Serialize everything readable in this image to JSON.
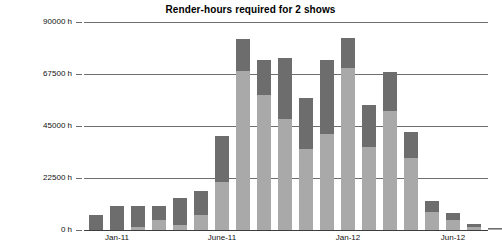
{
  "chart_data": {
    "type": "bar",
    "stacked": true,
    "title": "Render-hours required for 2 shows",
    "xlabel": "",
    "ylabel": "",
    "ylim": [
      0,
      90000
    ],
    "grid": true,
    "legend": "none",
    "y_unit": "h",
    "y_ticks": [
      {
        "value": 0,
        "label": "0 h"
      },
      {
        "value": 22500,
        "label": "22500 h"
      },
      {
        "value": 45000,
        "label": "45000 h"
      },
      {
        "value": 67500,
        "label": "67500 h"
      },
      {
        "value": 90000,
        "label": "90000 h"
      }
    ],
    "x_ticks": [
      {
        "index": 1,
        "label": "Jan-11"
      },
      {
        "index": 6,
        "label": "June-11"
      },
      {
        "index": 12,
        "label": "Jan-12"
      },
      {
        "index": 17,
        "label": "Jun-12"
      }
    ],
    "categories": [
      "Nov-10",
      "Dec-10",
      "Jan-11",
      "Feb-11",
      "Mar-11",
      "Apr-11",
      "May-11",
      "June-11",
      "Jul-11",
      "Aug-11",
      "Sep-11",
      "Oct-11",
      "Nov-11",
      "Dec-11",
      "Jan-12",
      "Feb-12",
      "Mar-12",
      "Apr-12",
      "May-12",
      "Jun-12"
    ],
    "series": [
      {
        "name": "Show A",
        "color": "#a9a9a9",
        "values": [
          0,
          0,
          1500,
          4200,
          2000,
          6500,
          21000,
          69000,
          58500,
          48000,
          35000,
          41500,
          70000,
          36000,
          51500,
          31000,
          8000,
          4500,
          1500,
          500
        ]
      },
      {
        "name": "Show B",
        "color": "#6d6d6d",
        "values": [
          6500,
          10500,
          9000,
          6000,
          12000,
          10500,
          19500,
          13500,
          15000,
          26500,
          22000,
          32000,
          13000,
          18000,
          17000,
          11500,
          4500,
          3000,
          900,
          300
        ]
      }
    ],
    "totals": [
      6500,
      10500,
      10500,
      10200,
      14000,
      17000,
      40500,
      82500,
      73500,
      74500,
      57000,
      73500,
      83000,
      54000,
      68500,
      42500,
      12500,
      7500,
      2400,
      800
    ]
  },
  "colors": {
    "series_a": "#a9a9a9",
    "series_b": "#6d6d6d",
    "gridline": "#6e6e6e",
    "axis": "#3d3d3d",
    "text": "#111111",
    "background": "#ffffff"
  }
}
